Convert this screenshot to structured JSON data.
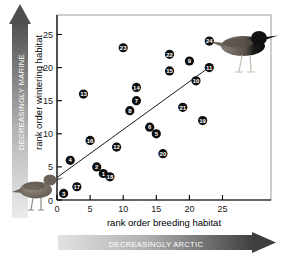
{
  "chart_data": {
    "type": "scatter",
    "title": "",
    "xlabel": "rank order breeding habitat",
    "ylabel": "rank order wintering habitat",
    "xlim": [
      0,
      26.5
    ],
    "ylim": [
      0,
      26.5
    ],
    "xticks": [
      0,
      5,
      10,
      15,
      20,
      25
    ],
    "yticks": [
      0,
      5,
      10,
      15,
      20,
      25
    ],
    "grid": false,
    "legend": "none",
    "point_label_mode": "numbered-marker",
    "points": [
      {
        "label": "3",
        "x": 1,
        "y": 1
      },
      {
        "label": "17",
        "x": 3,
        "y": 2
      },
      {
        "label": "4",
        "x": 2,
        "y": 6
      },
      {
        "label": "13",
        "x": 4,
        "y": 16
      },
      {
        "label": "16",
        "x": 5,
        "y": 9
      },
      {
        "label": "2",
        "x": 6,
        "y": 5
      },
      {
        "label": "1",
        "x": 7,
        "y": 4
      },
      {
        "label": "18",
        "x": 8,
        "y": 3.5
      },
      {
        "label": "12",
        "x": 9,
        "y": 8
      },
      {
        "label": "23",
        "x": 10,
        "y": 23
      },
      {
        "label": "8",
        "x": 11,
        "y": 13.5
      },
      {
        "label": "7",
        "x": 12,
        "y": 15
      },
      {
        "label": "14",
        "x": 12,
        "y": 17
      },
      {
        "label": "6",
        "x": 14,
        "y": 11
      },
      {
        "label": "5",
        "x": 15,
        "y": 10
      },
      {
        "label": "20",
        "x": 16,
        "y": 7
      },
      {
        "label": "22",
        "x": 17,
        "y": 22
      },
      {
        "label": "15",
        "x": 17,
        "y": 19.5
      },
      {
        "label": "21",
        "x": 19,
        "y": 14
      },
      {
        "label": "9",
        "x": 20,
        "y": 21
      },
      {
        "label": "10",
        "x": 21,
        "y": 18
      },
      {
        "label": "19",
        "x": 22,
        "y": 12
      },
      {
        "label": "11",
        "x": 23,
        "y": 20
      },
      {
        "label": "24",
        "x": 23,
        "y": 24
      }
    ],
    "trendline": {
      "type": "linear-fit",
      "x_start": 0,
      "y_start": 3.4,
      "x_end": 23.2,
      "y_end": 20.2
    }
  },
  "axes": {
    "x_title": "rank order breeding habitat",
    "y_title": "rank order wintering habitat",
    "x_tick_labels": [
      "0",
      "5",
      "10",
      "15",
      "20",
      "25"
    ],
    "y_tick_labels": [
      "0",
      "5",
      "10",
      "15",
      "20",
      "25"
    ]
  },
  "arrows": {
    "vertical": {
      "text": "DECREASINGLY MARINE",
      "direction": "up",
      "gradient_from": "#e6e6e6",
      "gradient_to": "#4a4a4a"
    },
    "horizontal": {
      "text": "DECREASINGLY ARCTIC",
      "direction": "right",
      "gradient_from": "#dcdcdc",
      "gradient_to": "#3d3d3d"
    }
  },
  "illustrations": [
    {
      "name": "wader-bird-pale",
      "position": "bottom-left",
      "description": "grey-brown wading bird"
    },
    {
      "name": "wader-bird-dark",
      "position": "top-right",
      "description": "black-bellied wading bird"
    }
  ],
  "colors": {
    "marker": "#0d0d0d",
    "marker_text": "#ffffff",
    "axis": "#000000",
    "frame": "#8c8c8c",
    "trendline": "#000000"
  }
}
